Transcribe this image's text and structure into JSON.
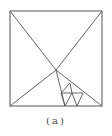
{
  "figure": {
    "caption": "(a)",
    "stroke_color": "#555555",
    "square": {
      "x1": 10,
      "y1": 11,
      "x2": 102,
      "y2": 106
    },
    "center_point": [
      56,
      70
    ],
    "lines": [
      [
        10,
        11,
        56,
        70
      ],
      [
        102,
        11,
        56,
        70
      ],
      [
        10,
        106,
        56,
        70
      ],
      [
        56,
        70,
        102,
        106
      ],
      [
        56,
        70,
        65,
        106
      ],
      [
        70,
        83,
        61,
        93
      ],
      [
        61,
        93,
        83,
        93
      ],
      [
        70,
        83,
        72,
        93
      ],
      [
        72,
        93,
        65,
        106
      ],
      [
        72,
        93,
        77,
        106
      ],
      [
        83,
        93,
        77,
        106
      ],
      [
        61,
        93,
        65,
        106
      ]
    ]
  }
}
